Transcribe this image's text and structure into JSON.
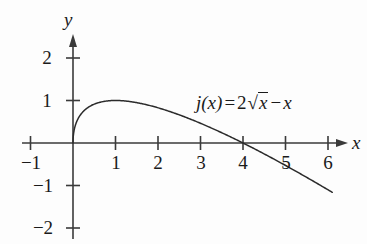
{
  "chart_data": {
    "type": "line",
    "title": "",
    "function_label": {
      "name": "j(x)",
      "relation": "=",
      "coefficient": "2",
      "radical": "√",
      "radicand": "x",
      "minus": "−",
      "linear_term": "x",
      "plain": "j(x) = 2√x − x"
    },
    "expression": "j(x) = 2*sqrt(x) - x",
    "xlabel": "x",
    "ylabel": "y",
    "xlim": [
      -1.2,
      6.4
    ],
    "ylim": [
      -2.3,
      2.4
    ],
    "xticks": [
      -1,
      1,
      2,
      3,
      4,
      5,
      6
    ],
    "xtick_labels": [
      "−1",
      "1",
      "2",
      "3",
      "4",
      "5",
      "6"
    ],
    "yticks": [
      2,
      1,
      -1,
      -2
    ],
    "ytick_labels": [
      "2",
      "1",
      "−1",
      "−2"
    ],
    "grid": false,
    "legend": "none",
    "domain_drawn": [
      0,
      6.1
    ],
    "x": [
      0,
      0.05,
      0.1,
      0.2,
      0.3,
      0.4,
      0.5,
      0.6,
      0.8,
      1,
      1.2,
      1.5,
      1.8,
      2,
      2.5,
      3,
      3.5,
      4,
      4.5,
      5,
      5.5,
      6,
      6.1
    ],
    "values": [
      0,
      0.397,
      0.532,
      0.694,
      0.795,
      0.865,
      0.914,
      0.949,
      0.989,
      1,
      0.991,
      0.949,
      0.883,
      0.828,
      0.662,
      0.464,
      0.241,
      0,
      -0.257,
      -0.528,
      -0.813,
      -1.101,
      -1.175
    ],
    "key_points": [
      {
        "label": "origin",
        "x": 0,
        "y": 0
      },
      {
        "label": "maximum",
        "x": 1,
        "y": 1
      },
      {
        "label": "x-intercept",
        "x": 4,
        "y": 0
      }
    ],
    "curve_color": "#2b2b2b",
    "axis_color": "#3a3a3a",
    "background_color": "#fdfdfd"
  },
  "axes": {
    "x_axis_name": "x",
    "y_axis_name": "y"
  }
}
